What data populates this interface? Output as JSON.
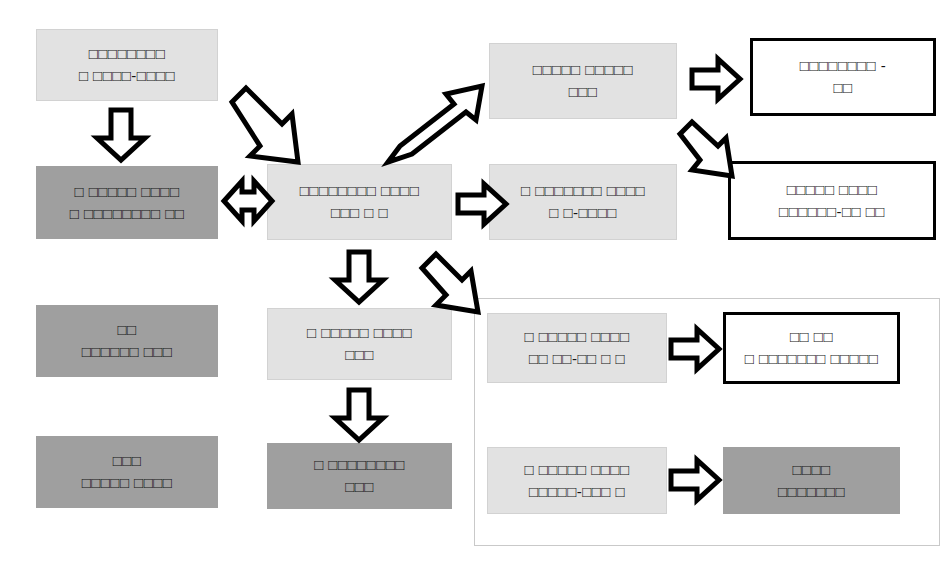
{
  "diagram": {
    "colors": {
      "light_fill": "#e2e2e2",
      "dark_fill": "#9f9f9f",
      "white_fill": "#ffffff",
      "outline": "#000000",
      "group_border": "#c9c9c9",
      "text": "#111111",
      "background": "#ffffff"
    },
    "nodes": [
      {
        "id": "node-top-left",
        "name": "node-top-left",
        "style": "light",
        "lines": [
          "□□□□□□□□",
          "□ □□□□-□□□□"
        ]
      },
      {
        "id": "node-mid-left-dark",
        "name": "node-mid-left-dark",
        "style": "dark",
        "lines": [
          "□ □□□□□ □□□□",
          "□ □□□□□□□□ □□"
        ]
      },
      {
        "id": "node-center",
        "name": "node-center",
        "style": "light",
        "lines": [
          "□□□□□□□□ □□□□",
          "□□□ □ □"
        ]
      },
      {
        "id": "node-top-mid-right",
        "name": "node-top-mid-right",
        "style": "light",
        "lines": [
          "□□□□□ □□□□□",
          "□□□"
        ]
      },
      {
        "id": "node-top-right-outlined",
        "name": "node-top-right-outlined",
        "style": "white-thick",
        "lines": [
          "□□□□□□□□ -",
          "□□"
        ]
      },
      {
        "id": "node-mid-right",
        "name": "node-mid-right",
        "style": "light",
        "lines": [
          "□ □□□□□□□ □□□□",
          "□ □-□□□□"
        ]
      },
      {
        "id": "node-mid-right-outlined",
        "name": "node-mid-right-outlined",
        "style": "white-thick",
        "lines": [
          "□□□□□ □□□□",
          "□□□□□□-□□ □□"
        ]
      },
      {
        "id": "node-lower-left-dark",
        "name": "node-lower-left-dark",
        "style": "dark",
        "lines": [
          "□□",
          "□□□□□□ □□□"
        ]
      },
      {
        "id": "node-bottom-left-dark",
        "name": "node-bottom-left-dark",
        "style": "dark",
        "lines": [
          "□□□",
          "□□□□□ □□□□"
        ]
      },
      {
        "id": "node-lower-center",
        "name": "node-lower-center",
        "style": "light",
        "lines": [
          "□ □□□□□ □□□□",
          "□□□"
        ]
      },
      {
        "id": "node-bottom-center-dark",
        "name": "node-bottom-center-dark",
        "style": "dark",
        "lines": [
          "□ □□□□□□□□",
          "□□□"
        ]
      },
      {
        "id": "node-group-upper-source",
        "name": "node-group-upper-source",
        "style": "light",
        "lines": [
          "□ □□□□□ □□□□",
          "□□ □□-□□ □ □"
        ]
      },
      {
        "id": "node-group-upper-target",
        "name": "node-group-upper-target",
        "style": "white-thick",
        "lines": [
          "□□ □□",
          "□ □□□□□□□ □□□□□"
        ]
      },
      {
        "id": "node-group-lower-source",
        "name": "node-group-lower-source",
        "style": "light",
        "lines": [
          "□ □□□□□ □□□□",
          "□□□□□-□□□ □"
        ]
      },
      {
        "id": "node-group-lower-target",
        "name": "node-group-lower-target",
        "style": "dark",
        "lines": [
          "□□□□",
          "□□□□□□□"
        ]
      }
    ],
    "group": {
      "name": "group-container-bottom-right",
      "label": ""
    },
    "arrows": [
      {
        "name": "arrow-down-topleft-to-midleft",
        "direction": "down"
      },
      {
        "name": "arrow-diagonal-topleft-to-center",
        "direction": "down-right"
      },
      {
        "name": "arrow-bidirectional-midleft-center",
        "direction": "both-horizontal"
      },
      {
        "name": "arrow-diagonal-center-to-topmidright",
        "direction": "up-right"
      },
      {
        "name": "arrow-right-center-to-midright",
        "direction": "right"
      },
      {
        "name": "arrow-right-topmidright-to-outlined",
        "direction": "right"
      },
      {
        "name": "arrow-diagonal-topright-to-midrightoutlined",
        "direction": "down-right"
      },
      {
        "name": "arrow-down-center-to-lowercenter",
        "direction": "down"
      },
      {
        "name": "arrow-diagonal-center-to-group",
        "direction": "down-right"
      },
      {
        "name": "arrow-down-lowercenter-to-bottomcenter",
        "direction": "down"
      },
      {
        "name": "arrow-right-group-upper",
        "direction": "right"
      },
      {
        "name": "arrow-right-group-lower",
        "direction": "right"
      }
    ]
  }
}
